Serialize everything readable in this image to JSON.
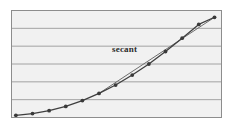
{
  "chart_data": {
    "type": "line",
    "title": "",
    "subtitle": "",
    "xlabel": "",
    "ylabel": "",
    "grid": true,
    "grid_axis": "y",
    "legend": false,
    "xlim": [
      0,
      12
    ],
    "ylim": [
      0,
      6
    ],
    "x_ticks_visible": false,
    "y_ticks_visible": false,
    "annotations": [
      {
        "name": "secant-label",
        "text": "secant",
        "x": 6.1,
        "y": 4.05
      }
    ],
    "series": [
      {
        "name": "curve",
        "type": "line",
        "marker": "circle",
        "color": "#3f3f3f",
        "x": [
          0.25,
          1.2,
          2.15,
          3.1,
          4.05,
          5.0,
          5.95,
          6.9,
          7.85,
          8.8,
          9.75,
          10.7,
          11.6
        ],
        "values": [
          0.12,
          0.22,
          0.38,
          0.62,
          0.95,
          1.35,
          1.82,
          2.38,
          3.0,
          3.7,
          4.45,
          5.22,
          5.62
        ],
        "points": [
          {
            "x": 0.25,
            "y": 0.12
          },
          {
            "x": 1.2,
            "y": 0.22
          },
          {
            "x": 2.15,
            "y": 0.38
          },
          {
            "x": 3.1,
            "y": 0.62
          },
          {
            "x": 4.05,
            "y": 0.95
          },
          {
            "x": 5.0,
            "y": 1.35
          },
          {
            "x": 5.95,
            "y": 1.82
          },
          {
            "x": 6.9,
            "y": 2.38
          },
          {
            "x": 7.85,
            "y": 3.0
          },
          {
            "x": 8.8,
            "y": 3.7
          },
          {
            "x": 9.75,
            "y": 4.45
          },
          {
            "x": 10.7,
            "y": 5.22
          },
          {
            "x": 11.6,
            "y": 5.62
          }
        ]
      },
      {
        "name": "secant",
        "type": "line",
        "marker": "none",
        "color": "#6e6e6e",
        "x": [
          5.0,
          11.6
        ],
        "values": [
          1.35,
          5.62
        ],
        "points": [
          {
            "x": 5.0,
            "y": 1.35
          },
          {
            "x": 11.6,
            "y": 5.62
          }
        ]
      }
    ],
    "gridlines_y": [
      1,
      2,
      3,
      4,
      5
    ],
    "colors": {
      "plot_background": "#f1f1f1",
      "page_background": "#ffffff",
      "gridline": "#9a9a9a",
      "frame": "#8d8d8d",
      "curve": "#3f3f3f",
      "secant": "#6e6e6e",
      "marker": "#3a3a3a",
      "label_text": "#2b2b2b"
    }
  }
}
